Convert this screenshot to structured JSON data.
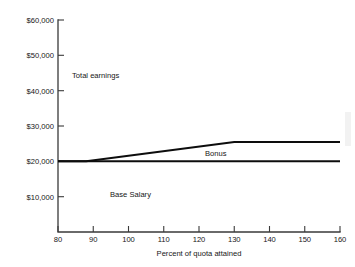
{
  "chart_data": {
    "type": "line",
    "title": "",
    "subtitle": "",
    "xlabel": "Percent of quota attained",
    "ylabel": "",
    "xlim": [
      80,
      160
    ],
    "ylim": [
      0,
      60000
    ],
    "grid": false,
    "legend_position": "none",
    "x_ticks": [
      80,
      90,
      100,
      110,
      120,
      130,
      140,
      150,
      160
    ],
    "x_tick_labels": [
      "80",
      "90",
      "100",
      "110",
      "120",
      "130",
      "140",
      "150",
      "160"
    ],
    "y_ticks": [
      10000,
      20000,
      30000,
      40000,
      50000,
      60000
    ],
    "y_tick_labels": [
      "$10,000",
      "$20,000",
      "$30,000",
      "$40,000",
      "$50,000",
      "$60,000"
    ],
    "series": [
      {
        "name": "Total earnings",
        "x": [
          80,
          88,
          130,
          160
        ],
        "values": [
          20000,
          20000,
          25500,
          25500
        ]
      },
      {
        "name": "Base Salary",
        "x": [
          80,
          160
        ],
        "values": [
          20000,
          20000
        ]
      }
    ],
    "annotations": [
      {
        "text": "Total earnings",
        "x": 92,
        "y": 43500
      },
      {
        "text": "Bonus",
        "x": 127,
        "y": 22300
      },
      {
        "text": "Base Salary",
        "x": 104,
        "y": 11200
      }
    ]
  },
  "axis": {
    "y_labels": {
      "v60000": "$60,000",
      "v50000": "$50,000",
      "v40000": "$40,000",
      "v30000": "$30,000",
      "v20000": "$20,000",
      "v10000": "$10,000"
    },
    "x_labels": {
      "v80": "80",
      "v90": "90",
      "v100": "100",
      "v110": "110",
      "v120": "120",
      "v130": "130",
      "v140": "140",
      "v150": "150",
      "v160": "160"
    },
    "x_title": "Percent of quota attained"
  },
  "annotations": {
    "total_earnings": "Total earnings",
    "bonus": "Bonus",
    "base_salary": "Base Salary"
  },
  "colors": {
    "line": "#0d0d0d",
    "axis": "#3a3a3a",
    "text": "#161616",
    "background": "#ffffff"
  }
}
